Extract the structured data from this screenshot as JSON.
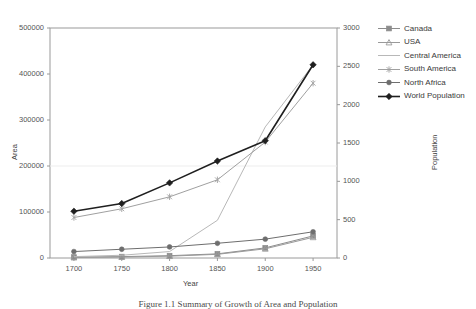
{
  "chart_data": {
    "type": "line",
    "title": "",
    "xlabel": "Year",
    "ylabel": "Area",
    "y2label": "Population",
    "x": [
      1700,
      1750,
      1800,
      1850,
      1900,
      1950
    ],
    "xtick_labels": [
      "1700",
      "1750",
      "1800",
      "1850",
      "1900",
      "1950"
    ],
    "xlim": [
      1675,
      1975
    ],
    "ylim": [
      0,
      500000
    ],
    "ytick_labels": [
      "0",
      "100000",
      "200000",
      "300000",
      "400000",
      "500000"
    ],
    "yticks": [
      0,
      100000,
      200000,
      300000,
      400000,
      500000
    ],
    "y2lim": [
      0,
      3000
    ],
    "y2tick_labels": [
      "0",
      "500",
      "1000",
      "1500",
      "2000",
      "2500",
      "3000"
    ],
    "y2ticks": [
      0,
      500,
      1000,
      1500,
      2000,
      2500,
      3000
    ],
    "grid": false,
    "legend_position": "right",
    "series": [
      {
        "name": "Canada",
        "axis": "left",
        "marker": "square",
        "color": "#8c8c8c",
        "values": [
          2000,
          3000,
          5000,
          9000,
          22000,
          48000
        ]
      },
      {
        "name": "USA",
        "axis": "left",
        "marker": "triangle",
        "color": "#9a9a9a",
        "values": [
          1000,
          2000,
          4000,
          8000,
          20000,
          45000
        ]
      },
      {
        "name": "Central America",
        "axis": "left",
        "marker": "none",
        "color": "#b8b8b8",
        "values": [
          3000,
          6000,
          14000,
          82000,
          285000,
          420000
        ]
      },
      {
        "name": "South America",
        "axis": "left",
        "marker": "cross",
        "color": "#a0a0a0",
        "values": [
          88000,
          107000,
          133000,
          170000,
          252000,
          380000
        ]
      },
      {
        "name": "North Africa",
        "axis": "left",
        "marker": "dot",
        "color": "#6e6e6e",
        "values": [
          14000,
          19000,
          24000,
          32000,
          41000,
          57000
        ]
      },
      {
        "name": "World Population",
        "axis": "right",
        "marker": "diamond",
        "color": "#1f1f1f",
        "values": [
          610,
          710,
          980,
          1265,
          1530,
          2520
        ]
      }
    ]
  },
  "caption": {
    "text": "Figure 1.1 Summary of Growth of Area and Population"
  }
}
